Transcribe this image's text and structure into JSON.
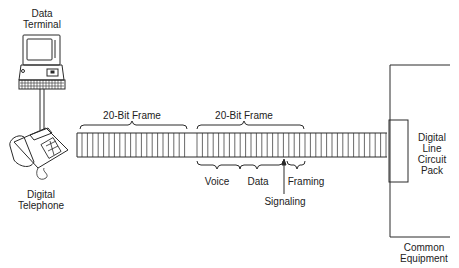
{
  "diagram": {
    "devices": {
      "terminal": {
        "label_line1": "Data",
        "label_line2": "Terminal",
        "icon": "computer-terminal-icon"
      },
      "telephone": {
        "label_line1": "Digital",
        "label_line2": "Telephone",
        "icon": "desk-telephone-icon"
      }
    },
    "bus": {
      "frames": [
        {
          "label": "20-Bit Frame"
        },
        {
          "label": "20-Bit Frame"
        }
      ],
      "fields": [
        {
          "label": "Voice"
        },
        {
          "label": "Data"
        },
        {
          "label": "Framing"
        }
      ],
      "signaling": {
        "label": "Signaling"
      }
    },
    "circuit_pack": {
      "line1": "Digital",
      "line2": "Line",
      "line3": "Circuit",
      "line4": "Pack"
    },
    "common_equipment": {
      "line1": "Common",
      "line2": "Equipment"
    },
    "colors": {
      "stroke": "#2a2a2a",
      "background": "#ffffff"
    }
  }
}
